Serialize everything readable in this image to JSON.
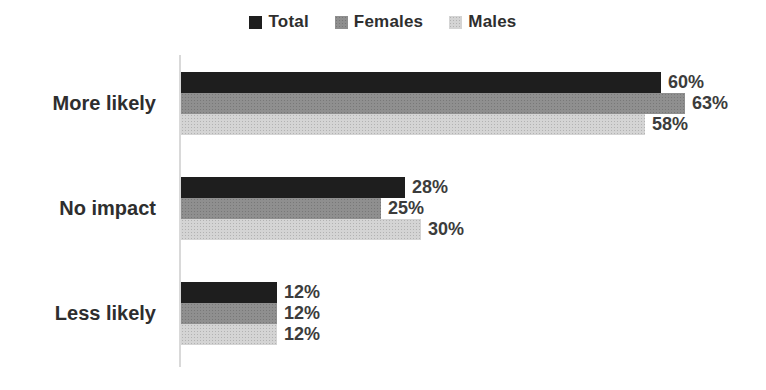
{
  "chart_data": {
    "type": "bar",
    "orientation": "horizontal",
    "title": "",
    "categories": [
      "More likely",
      "No impact",
      "Less likely"
    ],
    "series": [
      {
        "name": "Total",
        "color": "#1e1e1e",
        "values": [
          60,
          28,
          12
        ]
      },
      {
        "name": "Females",
        "color": "#8f8f8f",
        "values": [
          63,
          25,
          12
        ]
      },
      {
        "name": "Males",
        "color": "#d4d4d4",
        "values": [
          58,
          30,
          12
        ]
      }
    ],
    "value_suffix": "%",
    "xlim": [
      0,
      70
    ],
    "px_per_percent": 8,
    "legend_position": "top",
    "grid": false,
    "axis_color": "#d9d9d9",
    "label_color": "#2e2e2e",
    "value_label_color": "#3c3c3c",
    "background_color": "#ffffff"
  }
}
